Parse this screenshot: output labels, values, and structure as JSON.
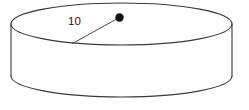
{
  "figure": {
    "type": "geometry-diagram",
    "shape_name": "cylinder",
    "background_color": "#ffffff",
    "stroke_color": "#3a3a3a",
    "label_color": "#1a1a1a",
    "dot_color": "#111111",
    "labels": {
      "radius": "10"
    },
    "geometry": {
      "top_ellipse": {
        "cx": 121.5,
        "cy": 24,
        "rx": 110.5,
        "ry": 21
      },
      "bottom_ellipse": {
        "cx": 121.5,
        "cy": 76,
        "rx": 110.5,
        "ry": 21
      },
      "left_side": {
        "x": 11,
        "y1": 24,
        "y2": 76
      },
      "right_side": {
        "x": 232,
        "y1": 24,
        "y2": 76
      },
      "center_dot": {
        "cx": 119.5,
        "cy": 17.5,
        "r": 4.2
      },
      "radius_segment": {
        "x1": 119.5,
        "y1": 17.5,
        "x2": 72.5,
        "y2": 43.5
      },
      "radius_label_pos": {
        "x": 68,
        "y": 25
      }
    }
  }
}
